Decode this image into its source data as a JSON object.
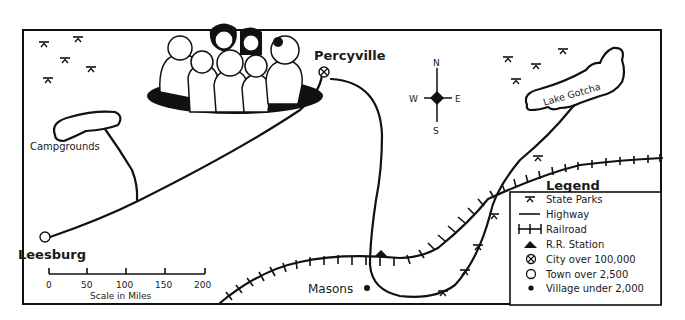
{
  "map": {
    "places": {
      "percyville": "Percyville",
      "leesburg": "Leesburg",
      "masons": "Masons",
      "campgrounds": "Campgrounds",
      "lake": "Lake Gotcha"
    },
    "compass": {
      "n": "N",
      "s": "S",
      "e": "E",
      "w": "W"
    },
    "scale": {
      "ticks": [
        "0",
        "50",
        "100",
        "150",
        "200"
      ],
      "caption": "Scale in Miles"
    },
    "legend": {
      "title": "Legend",
      "items": [
        {
          "icon": "state-park-icon",
          "label": "State Parks"
        },
        {
          "icon": "highway-icon",
          "label": "Highway"
        },
        {
          "icon": "railroad-icon",
          "label": "Railroad"
        },
        {
          "icon": "rr-station-icon",
          "label": "R.R. Station"
        },
        {
          "icon": "city-icon",
          "label": "City over 100,000"
        },
        {
          "icon": "town-icon",
          "label": "Town over 2,500"
        },
        {
          "icon": "village-icon",
          "label": "Village under 2,000"
        }
      ]
    },
    "colors": {
      "ink": "#111111",
      "paper": "#ffffff"
    }
  }
}
